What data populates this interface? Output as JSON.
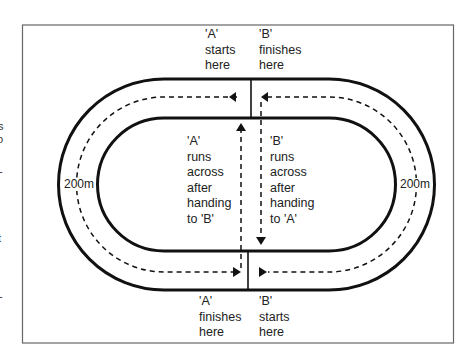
{
  "diagram": {
    "labels": {
      "a_starts": [
        "'A'",
        "starts",
        "here"
      ],
      "b_finishes": [
        "'B'",
        "finishes",
        "here"
      ],
      "a_runs_across": [
        "'A'",
        "runs",
        "across",
        "after",
        "handing",
        "to 'B'"
      ],
      "b_runs_across": [
        "'B'",
        "runs",
        "across",
        "after",
        "handing",
        "to 'A'"
      ],
      "a_finishes": [
        "'A'",
        "finishes",
        "here"
      ],
      "b_starts": [
        "'B'",
        "starts",
        "here"
      ],
      "left_distance": "200m",
      "right_distance": "200m"
    },
    "left_margin_fragments": [
      "s",
      "o",
      "-",
      "t",
      "-"
    ],
    "colors": {
      "line": "#111111",
      "frame": "#555555",
      "background": "#ffffff"
    }
  }
}
